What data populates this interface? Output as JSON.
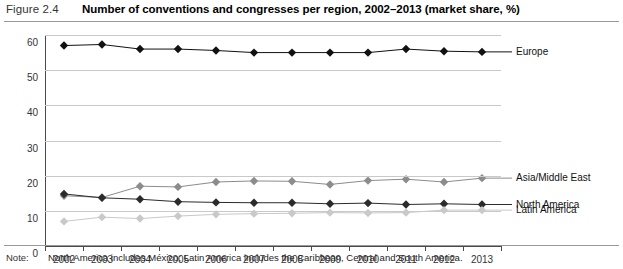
{
  "header": {
    "figure_number": "Figure 2.4",
    "title": "Number of conventions and congresses per region, 2002–2013 (market share, %)"
  },
  "note": {
    "label": "Note:",
    "text": "North America includes México; Latin America includes the Caribbean, Central and South America."
  },
  "colors": {
    "europe": "#111111",
    "asia_middle_east": "#8c8c8c",
    "north_america": "#2b2b2b",
    "latin_america": "#c9c9c9",
    "gridline": "#c9c9c9",
    "axis": "#4a4a4a"
  },
  "chart_data": {
    "type": "line",
    "title": "Number of conventions and congresses per region, 2002–2013 (market share, %)",
    "xlabel": "",
    "ylabel": "",
    "ylim": [
      0,
      60
    ],
    "yticks": [
      0,
      10,
      20,
      30,
      40,
      50,
      60
    ],
    "grid": true,
    "legend_position": "right",
    "categories": [
      "2002",
      "2003",
      "2004",
      "2005",
      "2006",
      "2007",
      "2008",
      "2009",
      "2010",
      "2011",
      "2012",
      "2013"
    ],
    "series": [
      {
        "name": "Europe",
        "color": "#111111",
        "marker": "diamond",
        "values": [
          57,
          57.3,
          56,
          56,
          55.6,
          55,
          55,
          55,
          55,
          56,
          55.4,
          55.2
        ]
      },
      {
        "name": "Asia/Middle East",
        "color": "#8c8c8c",
        "marker": "diamond",
        "values": [
          14.3,
          13.8,
          17,
          16.8,
          18.2,
          18.5,
          18.4,
          17.5,
          18.6,
          19,
          18.2,
          19.3
        ]
      },
      {
        "name": "North America",
        "color": "#2b2b2b",
        "marker": "diamond",
        "values": [
          14.8,
          13.7,
          13.3,
          12.6,
          12.4,
          12.3,
          12.3,
          12,
          12.2,
          11.8,
          12,
          11.8
        ]
      },
      {
        "name": "Latin America",
        "color": "#c9c9c9",
        "marker": "diamond",
        "values": [
          7,
          8.2,
          7.8,
          8.5,
          9,
          9.2,
          9.3,
          9.5,
          9.4,
          9.5,
          10.2,
          10.2
        ]
      }
    ]
  }
}
